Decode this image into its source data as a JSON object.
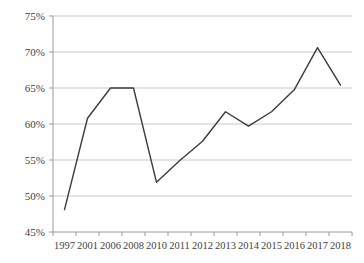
{
  "chart_data": {
    "type": "line",
    "title": "",
    "subtitle": "",
    "xlabel": "",
    "ylabel": "",
    "categories": [
      "1997",
      "2001",
      "2006",
      "2008",
      "2010",
      "2011",
      "2012",
      "2013",
      "2014",
      "2015",
      "2016",
      "2017",
      "2018"
    ],
    "series": [
      {
        "name": "",
        "values": [
          48.1,
          60.8,
          65.0,
          65.0,
          51.9,
          54.9,
          57.6,
          61.7,
          59.7,
          61.7,
          64.8,
          70.6,
          65.4
        ]
      }
    ],
    "ylim": [
      45,
      75
    ],
    "ytick_values": [
      45,
      50,
      55,
      60,
      65,
      70,
      75
    ],
    "ytick_labels": [
      "45%",
      "50%",
      "55%",
      "60%",
      "65%",
      "70%",
      "75%"
    ],
    "xtick_labels": [
      "1997",
      "2001",
      "2006",
      "2008",
      "2010",
      "2011",
      "2012",
      "2013",
      "2014",
      "2015",
      "2016",
      "2017",
      "2018"
    ],
    "grid": "horizontal",
    "legend": "none",
    "value_unit": "percent",
    "colors": {
      "line": "#3b3b3b",
      "gridline": "#c9c9c9",
      "axis": "#9a9a9a",
      "text": "#3f3f3f",
      "background": "#ffffff"
    }
  }
}
